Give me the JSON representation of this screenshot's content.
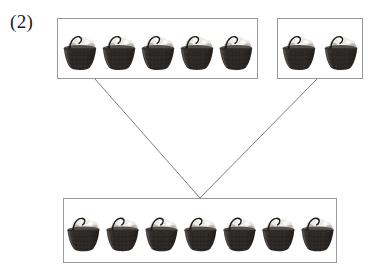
{
  "problem": {
    "label": "(2)"
  },
  "colors": {
    "box_border": "#9a9a9a",
    "connector_line": "#6e6e6e",
    "basket_body_dark": "#2f2b29",
    "basket_body_mid": "#4a4441",
    "basket_rim": "#564e49",
    "basket_contents_light": "#e9e7e2",
    "basket_contents_shadow": "#b4b0a8",
    "basket_handle": "#1a1a1a",
    "page_background": "#ffffff",
    "label_text": "#1c1c1c"
  },
  "groups": [
    {
      "id": "addend-1",
      "role": "addend",
      "count": 5,
      "item": "basket-of-eggs",
      "items": [
        "basket-1",
        "basket-2",
        "basket-3",
        "basket-4",
        "basket-5"
      ]
    },
    {
      "id": "addend-2",
      "role": "addend",
      "count": 2,
      "item": "basket-of-eggs",
      "items": [
        "basket-1",
        "basket-2"
      ]
    },
    {
      "id": "sum",
      "role": "sum",
      "count": 7,
      "item": "basket-of-eggs",
      "items": [
        "basket-1",
        "basket-2",
        "basket-3",
        "basket-4",
        "basket-5",
        "basket-6",
        "basket-7"
      ]
    }
  ],
  "connectors": [
    {
      "id": "connector-left",
      "from_group": "addend-1",
      "to_group": "sum",
      "x1": 95,
      "y1": 79,
      "x2": 200,
      "y2": 198
    },
    {
      "id": "connector-right",
      "from_group": "addend-2",
      "to_group": "sum",
      "x1": 317,
      "y1": 79,
      "x2": 200,
      "y2": 198
    }
  ]
}
